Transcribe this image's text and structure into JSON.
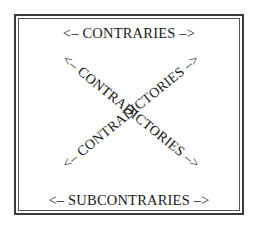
{
  "diagram": {
    "top_label": "<– CONTRARIES –>",
    "bottom_label": "<– SUBCONTRARIES –>",
    "diagonal_1_label": "<– CONTRADICTORIES –>",
    "diagonal_2_label": "<– CONTRADICTORIES –>",
    "colors": {
      "text": "#1a1a1a",
      "frame": "#3a3a3a",
      "background": "#ffffff"
    }
  }
}
